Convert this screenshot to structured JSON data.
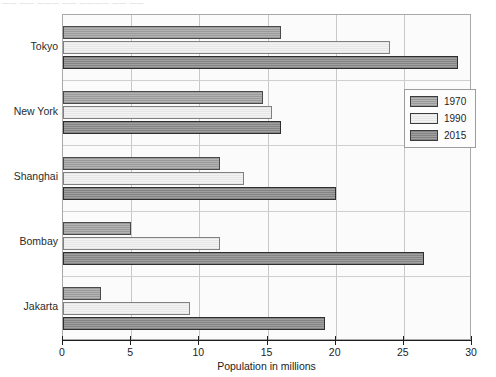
{
  "scan_artifact": {
    "top_clipped_text": "—— —— ——— —— ———— —— ——"
  },
  "chart_data": {
    "type": "bar",
    "orientation": "horizontal",
    "title": "",
    "xlabel": "Population in millions",
    "ylabel": "",
    "xlim": [
      0,
      30
    ],
    "xticks": [
      0,
      5,
      10,
      15,
      20,
      25,
      30
    ],
    "xticklabels": [
      "0",
      "5",
      "10",
      "15",
      "20",
      "25",
      "30"
    ],
    "grid": "vertical",
    "legend_position": "right",
    "categories": [
      "Tokyo",
      "New York",
      "Shanghai",
      "Bombay",
      "Jakarta"
    ],
    "series": [
      {
        "name": "1970",
        "color": "#a8a8a8",
        "values": [
          16.0,
          14.7,
          11.5,
          5.0,
          2.8
        ]
      },
      {
        "name": "1990",
        "color": "#ededed",
        "values": [
          24.0,
          15.3,
          13.3,
          11.5,
          9.3
        ]
      },
      {
        "name": "2015",
        "color": "#929292",
        "values": [
          29.0,
          16.0,
          20.0,
          26.5,
          19.2
        ]
      }
    ]
  }
}
